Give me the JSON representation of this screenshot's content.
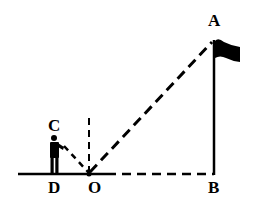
{
  "diagram": {
    "type": "geometry-reflection",
    "colors": {
      "stroke": "#000000",
      "background": "#ffffff"
    },
    "labels": {
      "A": "A",
      "B": "B",
      "C": "C",
      "D": "D",
      "O": "O"
    },
    "points": {
      "A": [
        214,
        40
      ],
      "B": [
        214,
        174
      ],
      "C": [
        55,
        137
      ],
      "D": [
        55,
        174
      ],
      "O": [
        89,
        174
      ]
    },
    "segments": [
      {
        "from": "D",
        "to": "O",
        "style": "solid",
        "note": "ground"
      },
      {
        "from": "O",
        "to": "B",
        "style": "dashed"
      },
      {
        "from": "B",
        "to": "A",
        "style": "solid",
        "note": "flagpole"
      },
      {
        "from": "C",
        "to": "O",
        "style": "dashed",
        "note": "line of sight"
      },
      {
        "from": "O",
        "to": "A",
        "style": "dashed",
        "note": "reflected ray"
      },
      {
        "from": "O",
        "to": "normal",
        "style": "dashed",
        "note": "normal at O"
      }
    ],
    "icons": [
      "person-icon",
      "flag-icon"
    ]
  }
}
